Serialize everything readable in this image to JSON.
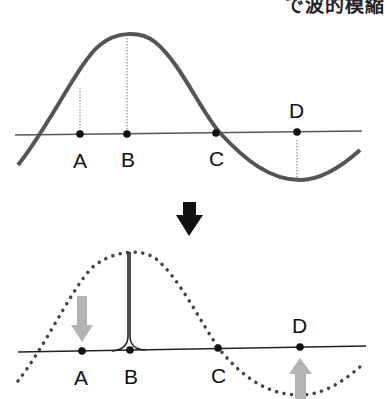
{
  "caption": "で波的模縮",
  "top_panel": {
    "labels": [
      "A",
      "B",
      "C",
      "D"
    ],
    "curve_color": "#555555",
    "axis_color": "#555555"
  },
  "transition_arrow": "down-arrow",
  "bottom_panel": {
    "labels": [
      "A",
      "B",
      "C",
      "D"
    ],
    "dotted_curve_color": "#444444",
    "displacement_arrow_color": "#b3b3b3"
  }
}
